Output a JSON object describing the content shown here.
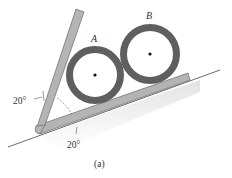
{
  "figure": {
    "caption": "(a)",
    "labels": {
      "ring_a": "A",
      "ring_b": "B"
    },
    "angles": {
      "left_angle": "20°",
      "bottom_angle": "20°"
    },
    "colors": {
      "ring": "#5f5f5f",
      "bracket_fill": "#b4b4b4",
      "bracket_edge": "#6a6a6a",
      "ground": "#444444",
      "shadow": "#e6e6e6"
    }
  }
}
